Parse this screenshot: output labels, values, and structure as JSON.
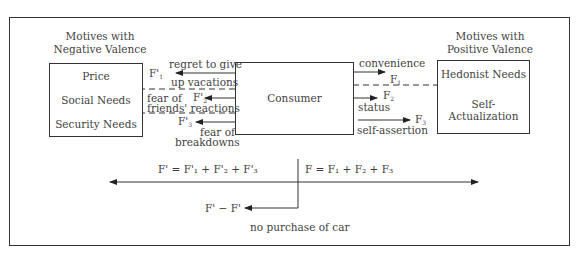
{
  "diagram": {
    "negative_heading": [
      "Motives with",
      "Negative Valence"
    ],
    "positive_heading": [
      "Motives with",
      "Positive Valence"
    ],
    "negative_box": [
      "Price",
      "Social Needs",
      "Security Needs"
    ],
    "positive_box": [
      "Hedonist Needs",
      "Self-Actualization"
    ],
    "center_box": "Consumer",
    "negative_forces": [
      {
        "label": "F'",
        "sub": "1",
        "text": [
          "regret to give",
          "up vacations"
        ]
      },
      {
        "label": "F'",
        "sub": "2",
        "text": [
          "fear of",
          "friends' reactions"
        ]
      },
      {
        "label": "F'",
        "sub": "3",
        "text": [
          "fear of",
          "breakdowns"
        ]
      }
    ],
    "positive_forces": [
      {
        "label": "F",
        "sub": "1",
        "text": "convenience"
      },
      {
        "label": "F",
        "sub": "2",
        "text": "status"
      },
      {
        "label": "F",
        "sub": "3",
        "text": "self-assertion"
      }
    ],
    "sum_negative": "F' = F'₁ + F'₂ + F'₃",
    "sum_positive": "F = F₁ + F₂ + F₃",
    "result_label": "F' − F'",
    "result_text": "no purchase of car"
  },
  "colors": {
    "line": "#333333",
    "text": "#3f3f3f"
  }
}
